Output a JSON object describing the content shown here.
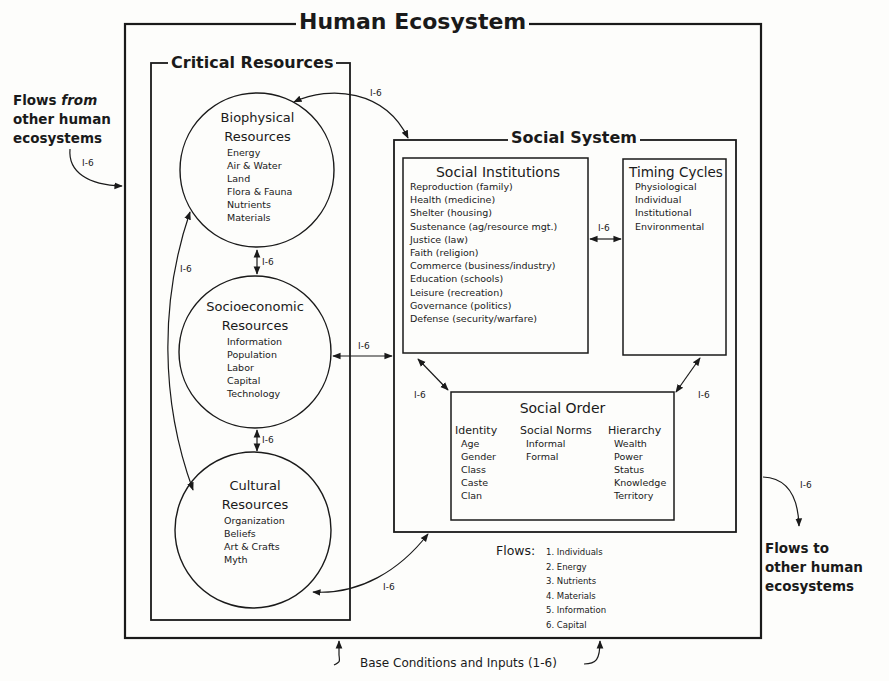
{
  "title": "Human Ecosystem",
  "flows_from": {
    "line1_a": "Flows ",
    "line1_b": "from",
    "line2": "other human",
    "line3": "ecosystems",
    "tag": "I-6"
  },
  "flows_to": {
    "line1": "Flows to",
    "line2": "other human",
    "line3": "ecosystems",
    "tag": "I-6"
  },
  "critical_resources": {
    "title": "Critical Resources",
    "biophysical": {
      "title1": "Biophysical",
      "title2": "Resources",
      "items": [
        "Energy",
        "Air & Water",
        "Land",
        "Flora & Fauna",
        "Nutrients",
        "Materials"
      ]
    },
    "socioeconomic": {
      "title1": "Socioeconomic",
      "title2": "Resources",
      "items": [
        "Information",
        "Population",
        "Labor",
        "Capital",
        "Technology"
      ]
    },
    "cultural": {
      "title1": "Cultural",
      "title2": "Resources",
      "items": [
        "Organization",
        "Beliefs",
        "Art & Crafts",
        "Myth"
      ]
    }
  },
  "social_system": {
    "title": "Social System",
    "institutions": {
      "title": "Social Institutions",
      "items": [
        "Reproduction (family)",
        "Health (medicine)",
        "Shelter (housing)",
        "Sustenance (ag/resource mgt.)",
        "Justice (law)",
        "Faith (religion)",
        "Commerce (business/industry)",
        "Education (schools)",
        "Leisure (recreation)",
        "Governance (politics)",
        "Defense (security/warfare)"
      ]
    },
    "timing_cycles": {
      "title": "Timing Cycles",
      "items": [
        "Physiological",
        "Individual",
        "Institutional",
        "Environmental"
      ]
    },
    "social_order": {
      "title": "Social Order",
      "identity": {
        "title": "Identity",
        "items": [
          "Age",
          "Gender",
          "Class",
          "Caste",
          "Clan"
        ]
      },
      "norms": {
        "title": "Social Norms",
        "items": [
          "Informal",
          "Formal"
        ]
      },
      "hierarchy": {
        "title": "Hierarchy",
        "items": [
          "Wealth",
          "Power",
          "Status",
          "Knowledge",
          "Territory"
        ]
      }
    }
  },
  "flows": {
    "label": "Flows:",
    "items": [
      "1.  Individuals",
      "2.  Energy",
      "3.  Nutrients",
      "4.  Materials",
      "5.  Information",
      "6.  Capital"
    ]
  },
  "base": "Base Conditions and Inputs (1-6)",
  "flow_tag": "I-6"
}
